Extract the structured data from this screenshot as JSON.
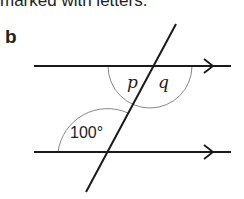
{
  "caption": "marked with letters.",
  "part_label": "b",
  "diagram": {
    "type": "parallel lines cut by a transversal",
    "angles": [
      {
        "label": "p",
        "position": "top intersection, below line, left of transversal"
      },
      {
        "label": "q",
        "position": "top intersection, below line, right of transversal"
      },
      {
        "label": "100°",
        "position": "bottom intersection, above line, left of transversal"
      }
    ],
    "colors": {
      "line": "#1a1a1a",
      "arc": "#888888"
    }
  }
}
